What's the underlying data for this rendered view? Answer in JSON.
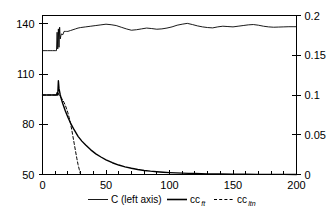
{
  "chart_data": {
    "type": "line",
    "title": "",
    "subtitle": "",
    "xlabel": "",
    "ylabel": "",
    "y2label": "",
    "xlim": [
      0,
      200
    ],
    "ylim": [
      50,
      145
    ],
    "y2lim": [
      0,
      0.2
    ],
    "grid": false,
    "legend_position": "bottom",
    "x_ticks_major": [
      0,
      50,
      100,
      150,
      200
    ],
    "x_ticks_major_labels": [
      "0",
      "50",
      "100",
      "150",
      "200"
    ],
    "x_ticks_minor_step": 10,
    "y_ticks_left": [
      50,
      80,
      110,
      140
    ],
    "y_ticks_left_labels": [
      "50",
      "80",
      "110",
      "140"
    ],
    "y_ticks_right": [
      0,
      0.05,
      0.1,
      0.15,
      0.2
    ],
    "y_ticks_right_labels": [
      "0",
      "0.05",
      "0.1",
      "0.15",
      "0.2"
    ],
    "series": [
      {
        "name": "C (left axis)",
        "axis": "left",
        "style": "solid",
        "width": 0.9,
        "x": [
          0,
          2,
          4,
          6,
          8,
          10,
          11,
          11.5,
          12,
          12.5,
          13,
          13.5,
          14,
          14.5,
          15,
          16,
          17,
          18,
          19,
          20,
          22,
          24,
          26,
          28,
          30,
          34,
          38,
          42,
          46,
          50,
          54,
          58,
          62,
          66,
          70,
          74,
          78,
          82,
          86,
          90,
          94,
          98,
          102,
          106,
          110,
          114,
          118,
          122,
          126,
          130,
          134,
          138,
          142,
          146,
          150,
          154,
          158,
          162,
          166,
          170,
          174,
          178,
          182,
          186,
          190,
          194,
          198,
          200
        ],
        "y": [
          124,
          124,
          124,
          124,
          124,
          124,
          124,
          135,
          125,
          137,
          126,
          138,
          131,
          133,
          134,
          133.5,
          135.5,
          135.5,
          135.5,
          135.5,
          136,
          136.5,
          137,
          137.5,
          137.8,
          138.2,
          138.6,
          139,
          139.4,
          139.8,
          139.5,
          139,
          138,
          137,
          136.2,
          136.5,
          137,
          137.5,
          137.2,
          136.8,
          137,
          137.5,
          138.2,
          139.2,
          139.8,
          140.3,
          139.6,
          138.8,
          138.2,
          137.8,
          137.6,
          138.2,
          138.6,
          138.4,
          138.2,
          138.6,
          139,
          139.4,
          139.6,
          139.2,
          138.6,
          138.2,
          138,
          138.1,
          138.2,
          138.3,
          138.3,
          138.3
        ]
      },
      {
        "name": "cc_ft",
        "label_base": "cc",
        "label_sub": "ft",
        "axis": "right",
        "style": "solid",
        "width": 1.4,
        "x": [
          0,
          2,
          4,
          6,
          8,
          10,
          11,
          11.5,
          12,
          12.5,
          13,
          14,
          15,
          16,
          18,
          20,
          22,
          25,
          28,
          31,
          34,
          38,
          42,
          46,
          50,
          55,
          60,
          65,
          70,
          75,
          80,
          85,
          90,
          95,
          100,
          105,
          110,
          115,
          120,
          125,
          130,
          140,
          150,
          160,
          170,
          180,
          190,
          200
        ],
        "y": [
          0.1,
          0.1,
          0.1,
          0.1,
          0.1,
          0.1,
          0.1,
          0.103,
          0.1,
          0.118,
          0.108,
          0.1,
          0.094,
          0.089,
          0.08,
          0.072,
          0.065,
          0.056,
          0.048,
          0.042,
          0.037,
          0.031,
          0.026,
          0.022,
          0.0185,
          0.0148,
          0.0119,
          0.0096,
          0.0078,
          0.0063,
          0.0051,
          0.0042,
          0.0035,
          0.0029,
          0.0024,
          0.002,
          0.0017,
          0.0014,
          0.0012,
          0.001,
          0.0008,
          0.0006,
          0.0004,
          0.0003,
          0.0002,
          0.0001,
          0.0001,
          0.0
        ]
      },
      {
        "name": "cc_ltn",
        "label_base": "cc",
        "label_sub": "ltn",
        "axis": "right",
        "style": "dashed",
        "width": 1.0,
        "x": [
          0,
          4,
          8,
          11,
          12,
          12.5,
          13,
          14,
          15,
          16,
          17,
          18,
          19,
          20,
          21,
          22,
          23,
          24,
          25,
          26,
          27,
          28,
          29,
          29.6,
          30
        ],
        "y": [
          0.1,
          0.1,
          0.1,
          0.1,
          0.101,
          0.102,
          0.1,
          0.098,
          0.096,
          0.0935,
          0.0905,
          0.087,
          0.0825,
          0.0775,
          0.0715,
          0.0645,
          0.0565,
          0.0475,
          0.0385,
          0.0295,
          0.0205,
          0.0125,
          0.006,
          0.002,
          0.0
        ]
      }
    ],
    "legend": [
      {
        "key": "c-left-axis",
        "label": "C (left axis)",
        "sub": "",
        "style": "solid",
        "width": 0.9
      },
      {
        "key": "cc-ft",
        "label": "cc",
        "sub": "ft",
        "style": "solid",
        "width": 1.6
      },
      {
        "key": "cc-ltn",
        "label": "cc",
        "sub": "ltn",
        "style": "dashed",
        "width": 1.0
      }
    ],
    "colors": {
      "line": "#000000",
      "axis": "#000000",
      "background": "#ffffff"
    }
  }
}
